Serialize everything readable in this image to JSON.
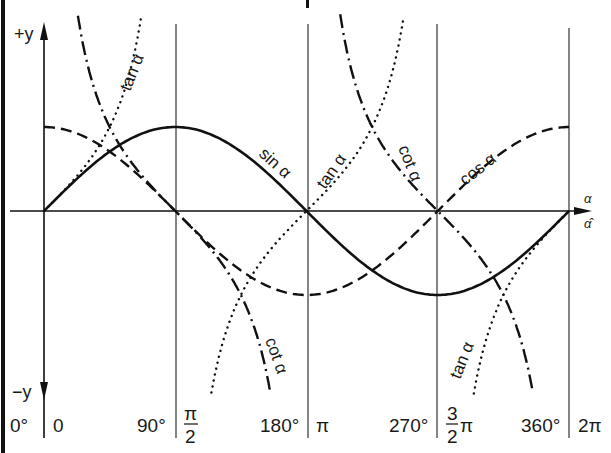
{
  "chart_data": {
    "type": "line",
    "title": "",
    "xlabel": "α",
    "xlabel_radians": "α̂",
    "ylabel_top": "+y",
    "ylabel_bottom": "−y",
    "xlim_rad": [
      0,
      6.2832
    ],
    "ylim": [
      -2.2,
      2.2
    ],
    "grid": "vertical lines at 0, π/2, π, 3π/2, 2π",
    "degree_ticks": [
      "0°",
      "90°",
      "180°",
      "270°",
      "360°"
    ],
    "radian_ticks": [
      {
        "num": "",
        "den": "",
        "text": "0"
      },
      {
        "num": "π",
        "den": "2",
        "text": ""
      },
      {
        "num": "",
        "den": "",
        "text": "π"
      },
      {
        "num": "3",
        "den": "2",
        "text": "π"
      },
      {
        "num": "",
        "den": "",
        "text": "2π"
      }
    ],
    "series": [
      {
        "name": "sin α",
        "style": "solid",
        "x": [
          0,
          1.5708,
          3.1416,
          4.7124,
          6.2832
        ],
        "values": [
          0,
          1,
          0,
          -1,
          0
        ]
      },
      {
        "name": "cos α",
        "style": "dashed",
        "x": [
          0,
          1.5708,
          3.1416,
          4.7124,
          6.2832
        ],
        "values": [
          1,
          0,
          -1,
          0,
          1
        ]
      },
      {
        "name": "tan α",
        "style": "dotted",
        "x": [
          0,
          0.7854,
          1.15,
          2.0,
          3.1416,
          3.927,
          4.28,
          5.13,
          6.2832
        ],
        "values": [
          0,
          1,
          2.2,
          -2.2,
          0,
          1,
          2.2,
          -2.2,
          0
        ]
      },
      {
        "name": "cot α",
        "style": "dash-dot",
        "x": [
          0.42,
          0.7854,
          1.5708,
          2.3562,
          2.72,
          3.56,
          3.927,
          4.7124,
          5.4978,
          5.86
        ],
        "values": [
          2.2,
          1,
          0,
          -1,
          -2.2,
          2.2,
          1,
          0,
          -1,
          -2.2
        ]
      }
    ],
    "curve_labels": [
      {
        "text": "tan α",
        "x": 122,
        "y": 72,
        "rot": -68
      },
      {
        "text": "sin α",
        "x": 254,
        "y": 160,
        "rot": 42
      },
      {
        "text": "tan α",
        "x": 332,
        "y": 170,
        "rot": -55
      },
      {
        "text": "cot α",
        "x": 405,
        "y": 160,
        "rot": 68
      },
      {
        "text": "cos α",
        "x": 488,
        "y": 160,
        "rot": -38
      },
      {
        "text": "cot α",
        "x": 262,
        "y": 355,
        "rot": 70
      },
      {
        "text": "tan α",
        "x": 468,
        "y": 358,
        "rot": -68
      }
    ]
  },
  "axes": {
    "plus_y": "+y",
    "minus_y": "−y",
    "alpha": "α",
    "alpha_hat": "α̂"
  },
  "ticks": {
    "deg_0": "0°",
    "rad_0": "0",
    "deg_90": "90°",
    "rad_90_num": "π",
    "rad_90_den": "2",
    "deg_180": "180°",
    "rad_180": "π",
    "deg_270": "270°",
    "rad_270_num": "3",
    "rad_270_den": "2",
    "rad_270_pi": "π",
    "deg_360": "360°",
    "rad_360": "2π"
  },
  "labels": {
    "tan_1": "tan α",
    "sin": "sin α",
    "tan_2": "tan α",
    "cot_1": "cot α",
    "cos": "cos α",
    "cot_2": "cot α",
    "tan_3": "tan α"
  }
}
